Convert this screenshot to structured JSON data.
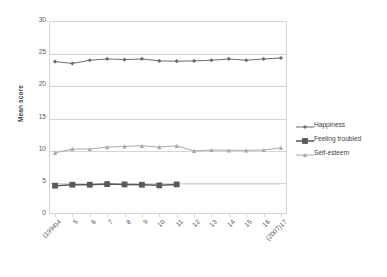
{
  "chart_data": {
    "type": "line",
    "title": "",
    "xlabel": "",
    "ylabel": "Mean score",
    "ylim": [
      0,
      30
    ],
    "yticks": [
      0,
      5,
      10,
      15,
      20,
      25,
      30
    ],
    "grid": true,
    "legend_position": "right",
    "categories": [
      "(1994)4",
      "5",
      "6",
      "7",
      "8",
      "9",
      "10",
      "11",
      "12",
      "13",
      "14",
      "15",
      "16",
      "(2007)17"
    ],
    "series": [
      {
        "name": "Happiness",
        "marker": "diamond",
        "color": "#6d6d6d",
        "values": [
          23.7,
          23.4,
          23.9,
          24.1,
          24.0,
          24.1,
          23.8,
          23.75,
          23.8,
          23.9,
          24.1,
          23.9,
          24.1,
          24.25
        ]
      },
      {
        "name": "Feeling troubled",
        "marker": "square",
        "color": "#595959",
        "values": [
          4.4,
          4.55,
          4.55,
          4.65,
          4.6,
          4.55,
          4.45,
          4.6,
          null,
          null,
          null,
          null,
          null,
          null
        ]
      },
      {
        "name": "Self-esteem",
        "marker": "triangle",
        "color": "#a6a6a6",
        "values": [
          9.5,
          10.1,
          10.1,
          10.4,
          10.5,
          10.6,
          10.4,
          10.6,
          9.8,
          9.95,
          9.9,
          9.9,
          9.95,
          10.3
        ]
      }
    ]
  },
  "legend": {
    "items": [
      {
        "label": "Happiness"
      },
      {
        "label": "Feeling troubled"
      },
      {
        "label": "Self-esteem"
      }
    ]
  },
  "colors": {
    "happiness": "#6d6d6d",
    "feeling_troubled": "#595959",
    "self_esteem": "#a6a6a6",
    "grid": "#d4d4d4",
    "text": "#595959"
  }
}
